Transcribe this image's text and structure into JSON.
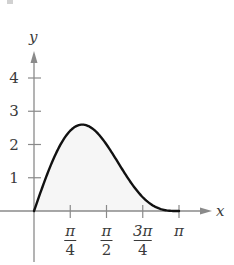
{
  "chart_data": {
    "type": "area",
    "title": "",
    "function": "y = 2 sin x + sin 2x",
    "xlabel": "x",
    "ylabel": "y",
    "xlim": [
      0,
      3.14159
    ],
    "ylim": [
      0,
      4
    ],
    "grid": false,
    "legend": "none",
    "x_ticks": [
      {
        "value": 0.7854,
        "num": "π",
        "den": "4"
      },
      {
        "value": 1.5708,
        "num": "π",
        "den": "2"
      },
      {
        "value": 2.3562,
        "num": "3π",
        "den": "4"
      },
      {
        "value": 3.1416,
        "num": "π",
        "den": ""
      }
    ],
    "y_ticks": [
      {
        "value": 1,
        "label": "1"
      },
      {
        "value": 2,
        "label": "2"
      },
      {
        "value": 3,
        "label": "3"
      },
      {
        "value": 4,
        "label": "4"
      }
    ],
    "x": [
      0,
      0.3927,
      0.7854,
      1.0472,
      1.1781,
      1.5708,
      1.9635,
      2.3562,
      2.7489,
      3.1416
    ],
    "values": [
      0,
      1.472,
      2.414,
      2.598,
      2.555,
      2.0,
      1.141,
      0.414,
      0.058,
      0
    ],
    "shaded_region": "area under curve from 0 to π",
    "colors": {
      "curve": "#111111",
      "fill": "#f6f6f6",
      "axis": "#8a8a8a",
      "text": "#3a3a3a"
    }
  }
}
